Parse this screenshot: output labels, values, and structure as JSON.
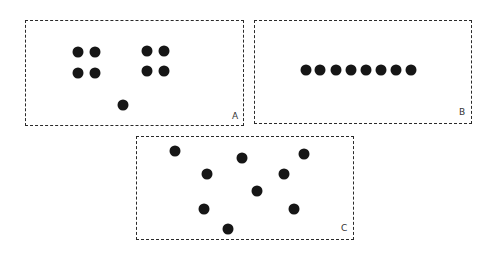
{
  "panels": [
    {
      "label": "A",
      "box": {
        "x": 25,
        "y": 20,
        "w": 219,
        "h": 106
      },
      "label_pos": {
        "x": 232,
        "y": 112
      },
      "dots": [
        [
          78,
          52
        ],
        [
          95,
          52
        ],
        [
          78,
          73
        ],
        [
          95,
          73
        ],
        [
          147,
          51
        ],
        [
          164,
          51
        ],
        [
          147,
          71
        ],
        [
          164,
          71
        ],
        [
          123,
          105
        ]
      ]
    },
    {
      "label": "B",
      "box": {
        "x": 254,
        "y": 20,
        "w": 218,
        "h": 104
      },
      "label_pos": {
        "x": 459,
        "y": 108
      },
      "dots": [
        [
          306,
          70
        ],
        [
          320,
          70
        ],
        [
          336,
          70
        ],
        [
          351,
          70
        ],
        [
          366,
          70
        ],
        [
          381,
          70
        ],
        [
          396,
          70
        ],
        [
          411,
          70
        ]
      ]
    },
    {
      "label": "C",
      "box": {
        "x": 136,
        "y": 136,
        "w": 218,
        "h": 104
      },
      "label_pos": {
        "x": 341,
        "y": 224
      },
      "dots": [
        [
          175,
          151
        ],
        [
          242,
          158
        ],
        [
          304,
          154
        ],
        [
          207,
          174
        ],
        [
          284,
          174
        ],
        [
          257,
          191
        ],
        [
          204,
          209
        ],
        [
          294,
          209
        ],
        [
          228,
          229
        ]
      ]
    }
  ],
  "colors": {
    "border": "#2a2a2a",
    "dot": "#161616",
    "background": "#ffffff"
  }
}
